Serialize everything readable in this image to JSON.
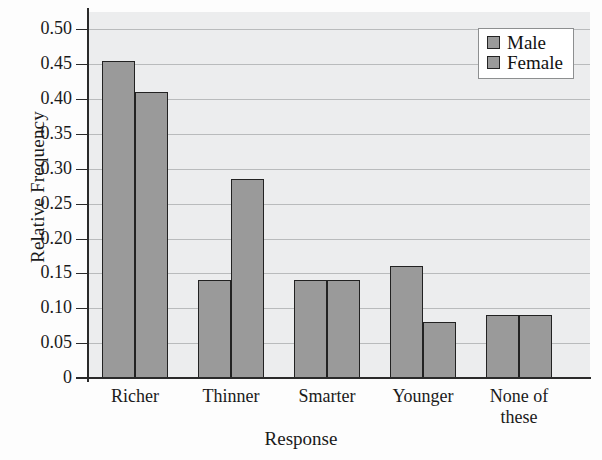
{
  "chart_data": {
    "type": "bar",
    "title": "",
    "xlabel": "Response",
    "ylabel": "Relative Frequency",
    "categories": [
      "Richer",
      "Thinner",
      "Smarter",
      "Younger",
      "None of these"
    ],
    "series": [
      {
        "name": "Male",
        "values": [
          0.455,
          0.14,
          0.14,
          0.16,
          0.09
        ],
        "color": "#9a9a9a"
      },
      {
        "name": "Female",
        "values": [
          0.41,
          0.285,
          0.14,
          0.08,
          0.09
        ],
        "color": "#9a9a9a"
      }
    ],
    "ylim": [
      0,
      0.525
    ],
    "ytick_labels": [
      "0",
      "0.05",
      "0.10",
      "0.15",
      "0.20",
      "0.25",
      "0.30",
      "0.35",
      "0.40",
      "0.45",
      "0.50"
    ],
    "ytick_values": [
      0,
      0.05,
      0.1,
      0.15,
      0.2,
      0.25,
      0.3,
      0.35,
      0.4,
      0.45,
      0.5
    ],
    "grid": "horizontal",
    "legend_position": "top-right",
    "legend_entries": [
      "Male",
      "Female"
    ],
    "plot_background": "#ecedee",
    "gridline_color": "#b9bbbc",
    "bar_edge_color": "#222222"
  },
  "category_lines": [
    [
      "Richer"
    ],
    [
      "Thinner"
    ],
    [
      "Smarter"
    ],
    [
      "Younger"
    ],
    [
      "None of",
      "these"
    ]
  ]
}
